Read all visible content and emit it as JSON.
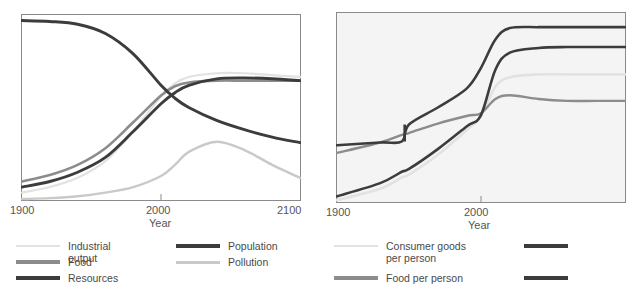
{
  "figure": {
    "title_partial": "",
    "background": "#ffffff"
  },
  "colors": {
    "very_light": "#e2e2e2",
    "light": "#c9c9c9",
    "mid_gray": "#8c8c8c",
    "dark_gray": "#6f6f6f",
    "dark": "#3c3c3c",
    "near_black": "#333333",
    "frame": "#8a8a8a",
    "text": "#555555",
    "right_panel_bg": "#f4f4f4"
  },
  "left_panel": {
    "name": "world-model-standard-run",
    "axis": {
      "xlabel": "Year",
      "xticks": [
        "1900",
        "2000",
        "2100"
      ],
      "xlim": [
        1900,
        2100
      ],
      "ylim": [
        0,
        1
      ]
    },
    "legend": {
      "items": [
        {
          "label": "Industrial output",
          "color": "#e2e2e2",
          "width": 2.2
        },
        {
          "label": "Food",
          "color": "#8c8c8c",
          "width": 3.2
        },
        {
          "label": "Resources",
          "color": "#3c3c3c",
          "width": 3.4
        },
        {
          "label": "Population",
          "color": "#3c3c3c",
          "width": 3.4
        },
        {
          "label": "Pollution",
          "color": "#c9c9c9",
          "width": 3.0
        }
      ]
    }
  },
  "right_panel": {
    "name": "material-standard-of-living",
    "axis": {
      "xlabel": "Year",
      "xticks": [
        "1900",
        "2000"
      ],
      "xlim": [
        1900,
        2100
      ],
      "ylim": [
        0,
        1
      ]
    },
    "legend": {
      "items": [
        {
          "label": "Consumer goods\nper person",
          "color": "#e2e2e2",
          "width": 2.4
        },
        {
          "label": "Food per person",
          "color": "#8c8c8c",
          "width": 3.2
        },
        {
          "label": "",
          "color": "#3c3c3c",
          "width": 3.4
        },
        {
          "label": "",
          "color": "#3c3c3c",
          "width": 3.4
        }
      ]
    }
  },
  "chart_data": [
    {
      "type": "line",
      "name": "left-chart",
      "title": "",
      "xlabel": "Year",
      "ylabel": "",
      "xlim": [
        1900,
        2100
      ],
      "ylim": [
        0,
        1
      ],
      "xticks": [
        1900,
        2000,
        2100
      ],
      "grid": false,
      "legend_position": "below",
      "x": [
        1900,
        1920,
        1940,
        1960,
        1980,
        2000,
        2010,
        2020,
        2040,
        2060,
        2080,
        2100
      ],
      "series": [
        {
          "name": "Resources",
          "color": "#3c3c3c",
          "values": [
            0.97,
            0.965,
            0.95,
            0.9,
            0.79,
            0.62,
            0.55,
            0.5,
            0.43,
            0.38,
            0.34,
            0.31
          ]
        },
        {
          "name": "Population",
          "color": "#3c3c3c",
          "values": [
            0.07,
            0.1,
            0.15,
            0.23,
            0.37,
            0.52,
            0.58,
            0.62,
            0.655,
            0.66,
            0.655,
            0.645
          ]
        },
        {
          "name": "Food",
          "color": "#8c8c8c",
          "values": [
            0.1,
            0.135,
            0.19,
            0.28,
            0.42,
            0.565,
            0.615,
            0.635,
            0.645,
            0.645,
            0.645,
            0.645
          ]
        },
        {
          "name": "Industrial output",
          "color": "#e2e2e2",
          "values": [
            0.04,
            0.07,
            0.12,
            0.21,
            0.37,
            0.56,
            0.63,
            0.665,
            0.685,
            0.685,
            0.675,
            0.665
          ]
        },
        {
          "name": "Pollution",
          "color": "#c9c9c9",
          "values": [
            0.005,
            0.01,
            0.02,
            0.04,
            0.07,
            0.13,
            0.19,
            0.26,
            0.315,
            0.27,
            0.19,
            0.12
          ]
        }
      ]
    },
    {
      "type": "line",
      "name": "right-chart",
      "title": "",
      "xlabel": "Year",
      "ylabel": "",
      "xlim": [
        1900,
        2100
      ],
      "ylim": [
        0,
        1
      ],
      "xticks": [
        1900,
        2000
      ],
      "grid": false,
      "legend_position": "below",
      "x": [
        1900,
        1930,
        1945,
        1950,
        1970,
        1990,
        2000,
        2010,
        2020,
        2040,
        2060,
        2080,
        2100
      ],
      "series": [
        {
          "name": "Life expectancy",
          "color": "#3c3c3c",
          "values": [
            0.3,
            0.315,
            0.32,
            0.41,
            0.5,
            0.6,
            0.71,
            0.86,
            0.92,
            0.925,
            0.925,
            0.925,
            0.925
          ]
        },
        {
          "name": "Services per person",
          "color": "#3c3c3c",
          "values": [
            0.03,
            0.1,
            0.16,
            0.175,
            0.28,
            0.4,
            0.46,
            0.7,
            0.79,
            0.815,
            0.82,
            0.82,
            0.82
          ]
        },
        {
          "name": "Consumer goods per person",
          "color": "#e2e2e2",
          "values": [
            0.01,
            0.07,
            0.13,
            0.145,
            0.25,
            0.38,
            0.455,
            0.61,
            0.66,
            0.675,
            0.675,
            0.675,
            0.675
          ]
        },
        {
          "name": "Food per person",
          "color": "#8c8c8c",
          "values": [
            0.26,
            0.315,
            0.355,
            0.365,
            0.415,
            0.455,
            0.47,
            0.545,
            0.565,
            0.545,
            0.535,
            0.535,
            0.535
          ]
        }
      ]
    }
  ]
}
